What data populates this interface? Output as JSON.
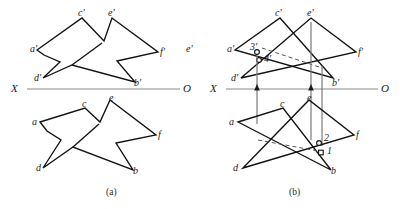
{
  "figure": {
    "caption_a": "(a)",
    "caption_b": "(b)",
    "colors": {
      "line": "#111111",
      "axis": "#8a8a8a",
      "hidden": "#555555",
      "projector": "#7a7a7a",
      "background": "#ffffff"
    },
    "axis": {
      "x_label": "X",
      "o_label": "O",
      "y_left": 89,
      "y_right": 89
    },
    "diagram_a": {
      "name": "overlap-outline-view",
      "frontal_labels": [
        {
          "text": "a'",
          "x": 30,
          "y": 44
        },
        {
          "text": "c'",
          "x": 78,
          "y": 8
        },
        {
          "text": "e'",
          "x": 108,
          "y": 8
        },
        {
          "text": "f'",
          "x": 160,
          "y": 47
        },
        {
          "text": "b'",
          "x": 134,
          "y": 78
        },
        {
          "text": "d'",
          "x": 34,
          "y": 73
        },
        {
          "text": "e'",
          "x": 186,
          "y": 44
        }
      ],
      "horizontal_labels": [
        {
          "text": "a",
          "x": 32,
          "y": 117
        },
        {
          "text": "c",
          "x": 82,
          "y": 99
        },
        {
          "text": "e",
          "x": 109,
          "y": 93
        },
        {
          "text": "f",
          "x": 158,
          "y": 130
        },
        {
          "text": "b",
          "x": 133,
          "y": 166
        },
        {
          "text": "d",
          "x": 36,
          "y": 163
        }
      ]
    },
    "diagram_b": {
      "name": "intersection-solution-view",
      "frontal_labels": [
        {
          "text": "a'",
          "x": 227,
          "y": 44
        },
        {
          "text": "c'",
          "x": 275,
          "y": 8
        },
        {
          "text": "e'",
          "x": 307,
          "y": 8
        },
        {
          "text": "f'",
          "x": 358,
          "y": 47
        },
        {
          "text": "b'",
          "x": 332,
          "y": 78
        },
        {
          "text": "d'",
          "x": 231,
          "y": 73
        },
        {
          "text": "3'",
          "x": 250,
          "y": 43
        },
        {
          "text": "4'",
          "x": 262,
          "y": 54
        }
      ],
      "horizontal_labels": [
        {
          "text": "a",
          "x": 229,
          "y": 117
        },
        {
          "text": "c",
          "x": 280,
          "y": 99
        },
        {
          "text": "e",
          "x": 307,
          "y": 93
        },
        {
          "text": "f",
          "x": 356,
          "y": 130
        },
        {
          "text": "b",
          "x": 331,
          "y": 166
        },
        {
          "text": "d",
          "x": 233,
          "y": 163
        },
        {
          "text": "2",
          "x": 322,
          "y": 136
        },
        {
          "text": "1",
          "x": 325,
          "y": 148
        }
      ],
      "projector_count": 4,
      "point_markers": [
        "3'",
        "4'",
        "1",
        "2"
      ]
    }
  }
}
